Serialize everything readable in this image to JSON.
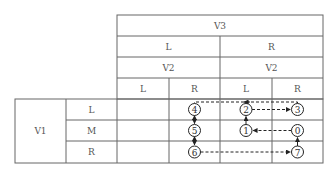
{
  "header": {
    "top": "V3",
    "v3_values": [
      "L",
      "R"
    ],
    "v2_labels": [
      "V2",
      "V2"
    ],
    "v2_values": [
      "L",
      "R",
      "L",
      "R"
    ]
  },
  "rows": {
    "group_label": "V1",
    "values": [
      "L",
      "M",
      "R"
    ]
  },
  "nodes": [
    {
      "id": "0",
      "row": 1,
      "col": 3
    },
    {
      "id": "1",
      "row": 1,
      "col": 2
    },
    {
      "id": "2",
      "row": 0,
      "col": 2
    },
    {
      "id": "3",
      "row": 0,
      "col": 3
    },
    {
      "id": "4",
      "row": 0,
      "col": 1
    },
    {
      "id": "5",
      "row": 1,
      "col": 1
    },
    {
      "id": "6",
      "row": 2,
      "col": 1
    },
    {
      "id": "7",
      "row": 2,
      "col": 3
    }
  ],
  "edges": [
    {
      "from": "0",
      "to": "1",
      "style": "dashed"
    },
    {
      "from": "1",
      "to": "2",
      "style": "solid"
    },
    {
      "from": "2",
      "to": "3",
      "style": "dashed"
    },
    {
      "from": "3",
      "to": "4",
      "style": "dashed",
      "via": "top",
      "arrow_mid": "2"
    },
    {
      "from": "4",
      "to": "5",
      "style": "solid",
      "bidirectional": true
    },
    {
      "from": "5",
      "to": "6",
      "style": "solid",
      "bidirectional": true
    },
    {
      "from": "6",
      "to": "7",
      "style": "dashed"
    },
    {
      "from": "7",
      "to": "0",
      "style": "solid"
    }
  ]
}
